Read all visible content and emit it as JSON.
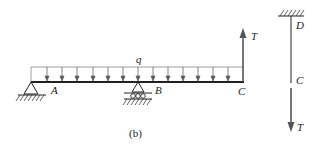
{
  "caption": "(b)",
  "labels": {
    "load": "q",
    "support_a": "A",
    "support_b": "B",
    "beam_end": "C",
    "force_up": "T",
    "cable_top": "D",
    "cable_cut": "C",
    "force_down": "T"
  },
  "colors": {
    "line": "#222222",
    "load_line": "#777777",
    "arrow": "#555555"
  }
}
